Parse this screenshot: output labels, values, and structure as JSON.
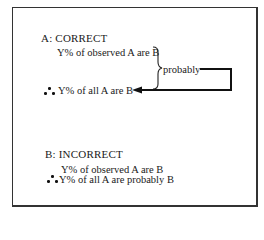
{
  "section_a": {
    "heading": "A:  CORRECT",
    "premise": "Y% of observed A are B",
    "connector_label": "probably",
    "conclusion": "Y% of all A are B",
    "therefore_icon": "therefore-symbol"
  },
  "section_b": {
    "heading": "B:  INCORRECT",
    "premise": "Y% of observed A are B",
    "conclusion": "Y% of all A are probably B",
    "therefore_icon": "therefore-symbol"
  }
}
